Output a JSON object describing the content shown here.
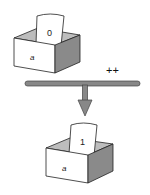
{
  "diagram": {
    "operator": "++",
    "before": {
      "variable": "a",
      "value": "0"
    },
    "after": {
      "variable": "a",
      "value": "1"
    },
    "colors": {
      "outline": "#222222",
      "box_front": "#ffffff",
      "box_side": "#8a8a8a",
      "box_inside": "#bdbdbd",
      "bar": "#888888"
    }
  }
}
